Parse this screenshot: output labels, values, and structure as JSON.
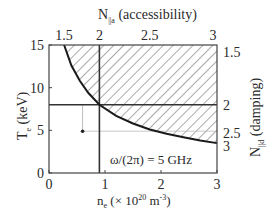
{
  "chart_data": {
    "type": "line",
    "title": "",
    "annotation": "ω/(2π) = 5 GHz",
    "xlabel": {
      "main": "n",
      "sub": "e",
      "rest": " (× 10",
      "sup": "20",
      "unit": " m",
      "unit_sup": "-3",
      "close": ")"
    },
    "ylabel": {
      "main": "T",
      "sub": "e",
      "rest": " (keV)"
    },
    "top_xlabel": {
      "main": "N",
      "sub": "||a",
      "rest": " (accessibility)"
    },
    "right_ylabel": {
      "main": "N",
      "sub": "||d",
      "rest": " (damping)"
    },
    "xlim": [
      0,
      3
    ],
    "ylim": [
      0,
      15
    ],
    "x_ticks": [
      0,
      1,
      2,
      3
    ],
    "x_tick_labels": [
      "0",
      "1",
      "2",
      "3"
    ],
    "y_ticks": [
      0,
      5,
      10,
      15
    ],
    "y_tick_labels": [
      "0",
      "5",
      "10",
      "15"
    ],
    "top_ticks": [
      {
        "label": "1.5",
        "x": 0.27
      },
      {
        "label": "2",
        "x": 0.9
      },
      {
        "label": "2.5",
        "x": 1.8
      },
      {
        "label": "3",
        "x": 2.93
      }
    ],
    "right_ticks": [
      {
        "label": "1.5",
        "y": 14.2
      },
      {
        "label": "2",
        "y": 8.0
      },
      {
        "label": "2.5",
        "y": 4.7
      },
      {
        "label": "3",
        "y": 3.2
      }
    ],
    "series": [
      {
        "name": "accessibility-damping boundary",
        "x": [
          0.27,
          0.4,
          0.55,
          0.7,
          0.9,
          1.2,
          1.5,
          1.8,
          2.1,
          2.4,
          2.7,
          3.0
        ],
        "y": [
          15.0,
          12.6,
          10.8,
          9.4,
          8.0,
          6.7,
          5.8,
          5.1,
          4.6,
          4.2,
          3.8,
          3.5
        ]
      }
    ],
    "reference_lines": {
      "vertical_x": 0.9,
      "horizontal_y": 8.0,
      "faint_horizontal_y": 4.7
    },
    "marker_point": {
      "x": 0.6,
      "y": 4.9
    },
    "hatched_region": "above boundary curve",
    "grid": false
  }
}
